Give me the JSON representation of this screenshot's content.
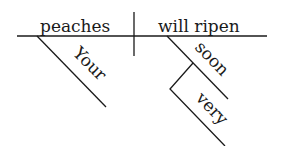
{
  "diagram": {
    "type": "sentence-diagram",
    "sentence": "Your peaches will ripen very soon",
    "subject": "peaches",
    "predicate": "will ripen",
    "modifiers": {
      "subject_modifier": "Your",
      "verb_modifier": "soon",
      "adverb_modifier": "very"
    }
  }
}
